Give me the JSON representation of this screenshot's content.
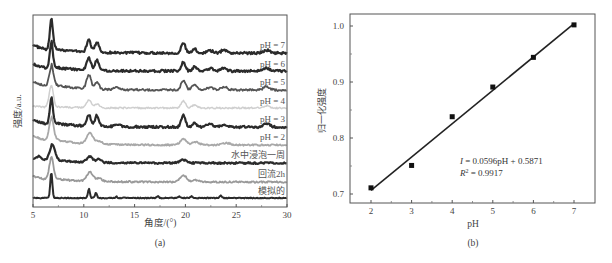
{
  "chart_data": [
    {
      "type": "line",
      "panel_label": "(a)",
      "title": "",
      "xlabel": "角度/(°)",
      "ylabel": "强度/a.u.",
      "xlim": [
        5,
        30
      ],
      "xticks": [
        5,
        10,
        15,
        20,
        25,
        30
      ],
      "grid": false,
      "legend_position": "inline-right",
      "series": [
        {
          "name": "pH = 7",
          "color": "#2b2b2b",
          "baseline_px": 53,
          "label_px": 45,
          "peaks": [
            [
              6.8,
              30,
              0.15
            ],
            [
              10.5,
              12,
              0.2
            ],
            [
              11.3,
              10,
              0.2
            ],
            [
              19.8,
              10,
              0.2
            ],
            [
              20.9,
              4,
              0.2
            ],
            [
              22.4,
              2.5,
              0.3
            ],
            [
              23.8,
              3.5,
              0.25
            ],
            [
              28.0,
              3,
              0.3
            ]
          ],
          "shoulder": 8,
          "noise": 1.2,
          "width": 2.2
        },
        {
          "name": "pH = 6",
          "color": "#2b2b2b",
          "baseline_px": 71,
          "label_px": 64,
          "peaks": [
            [
              6.8,
              26,
              0.15
            ],
            [
              10.5,
              12,
              0.2
            ],
            [
              11.3,
              10,
              0.2
            ],
            [
              19.8,
              9,
              0.2
            ],
            [
              20.9,
              4,
              0.2
            ],
            [
              22.4,
              2.5,
              0.3
            ],
            [
              23.8,
              3.5,
              0.25
            ],
            [
              28.0,
              3,
              0.3
            ]
          ],
          "shoulder": 7,
          "noise": 1.2,
          "width": 2.2
        },
        {
          "name": "pH = 5",
          "color": "#555555",
          "baseline_px": 90,
          "label_px": 82,
          "peaks": [
            [
              6.8,
              20,
              0.2
            ],
            [
              10.5,
              14,
              0.22
            ],
            [
              11.3,
              7,
              0.2
            ],
            [
              13.3,
              2,
              0.3
            ],
            [
              19.8,
              10,
              0.22
            ],
            [
              20.9,
              5,
              0.25
            ],
            [
              22.4,
              2.5,
              0.3
            ],
            [
              23.8,
              3,
              0.3
            ],
            [
              28.0,
              3.5,
              0.3
            ]
          ],
          "shoulder": 9,
          "noise": 1.0,
          "width": 1.8
        },
        {
          "name": "pH = 4",
          "color": "#cfcfcf",
          "baseline_px": 108,
          "label_px": 101,
          "peaks": [
            [
              6.8,
              22,
              0.2
            ],
            [
              10.5,
              8,
              0.22
            ],
            [
              11.3,
              4,
              0.2
            ],
            [
              19.8,
              7,
              0.22
            ],
            [
              20.9,
              3,
              0.25
            ],
            [
              28.0,
              2.5,
              0.3
            ]
          ],
          "shoulder": 2,
          "noise": 0.8,
          "width": 1.5
        },
        {
          "name": "pH = 3",
          "color": "#2b2b2b",
          "baseline_px": 127,
          "label_px": 119,
          "peaks": [
            [
              6.8,
              26,
              0.15
            ],
            [
              10.5,
              11,
              0.2
            ],
            [
              11.3,
              11,
              0.2
            ],
            [
              13.3,
              2,
              0.3
            ],
            [
              19.8,
              12,
              0.2
            ],
            [
              20.9,
              4,
              0.2
            ],
            [
              22.4,
              3,
              0.3
            ],
            [
              23.8,
              3,
              0.25
            ],
            [
              28.0,
              3.5,
              0.3
            ]
          ],
          "shoulder": 7,
          "noise": 1.1,
          "width": 2.2
        },
        {
          "name": "pH = 2",
          "color": "#a8a8a8",
          "baseline_px": 145,
          "label_px": 137,
          "peaks": [
            [
              6.8,
              22,
              0.22
            ],
            [
              10.6,
              11,
              0.3
            ],
            [
              11.5,
              3,
              0.3
            ],
            [
              19.8,
              6,
              0.3
            ],
            [
              21.0,
              3,
              0.35
            ],
            [
              24.0,
              2,
              0.4
            ]
          ],
          "shoulder": 10,
          "noise": 0.8,
          "width": 1.8
        },
        {
          "name": "水中浸泡一周",
          "color": "#2b2b2b",
          "baseline_px": 163,
          "label_px": 155,
          "peaks": [
            [
              5.6,
              3,
              0.2
            ],
            [
              6.9,
              15,
              0.28
            ],
            [
              10.6,
              6,
              0.3
            ],
            [
              11.5,
              4,
              0.2
            ],
            [
              19.8,
              3,
              0.3
            ]
          ],
          "shoulder": 5,
          "noise": 0.9,
          "width": 2.2
        },
        {
          "name": "回流2h",
          "color": "#9a9a9a",
          "baseline_px": 182,
          "label_px": 174,
          "peaks": [
            [
              6.8,
              22,
              0.2
            ],
            [
              10.6,
              9,
              0.3
            ],
            [
              11.5,
              3,
              0.3
            ],
            [
              19.8,
              7,
              0.3
            ],
            [
              21.0,
              2,
              0.35
            ]
          ],
          "shoulder": 6,
          "noise": 0.8,
          "width": 1.8
        },
        {
          "name": "模拟的",
          "color": "#2b2b2b",
          "baseline_px": 198,
          "label_px": 191,
          "peaks": [
            [
              6.8,
              26,
              0.1
            ],
            [
              10.5,
              9,
              0.1
            ],
            [
              11.2,
              5,
              0.1
            ],
            [
              13.2,
              1.5,
              0.1
            ],
            [
              17.3,
              1.5,
              0.1
            ],
            [
              19.4,
              1.5,
              0.1
            ],
            [
              20.6,
              1.5,
              0.1
            ],
            [
              23.5,
              2.5,
              0.1
            ]
          ],
          "shoulder": 0,
          "noise": 0.4,
          "width": 2.0
        }
      ]
    },
    {
      "type": "scatter",
      "panel_label": "(b)",
      "title": "",
      "xlabel": "pH",
      "ylabel": "归一化强度",
      "xlim": [
        1.5,
        7.5
      ],
      "ylim": [
        0.68,
        1.025
      ],
      "xticks": [
        2,
        3,
        4,
        5,
        6,
        7
      ],
      "yticks": [
        0.7,
        0.8,
        0.9,
        1.0
      ],
      "yticklabels": [
        "0.7",
        "0.8",
        "0.9",
        "1.0"
      ],
      "grid": false,
      "x": [
        2,
        3,
        4,
        5,
        6,
        7
      ],
      "values": [
        0.711,
        0.751,
        0.838,
        0.891,
        0.944,
        1.002
      ],
      "fit": {
        "slope": 0.0596,
        "intercept": 0.5871,
        "x_range": [
          2,
          7
        ]
      },
      "annotation": {
        "line1": "I = 0.0596pH + 0.5871",
        "line2_prefix": "R",
        "line2_sup": "2",
        "line2_suffix": " = 0.9917"
      }
    }
  ]
}
